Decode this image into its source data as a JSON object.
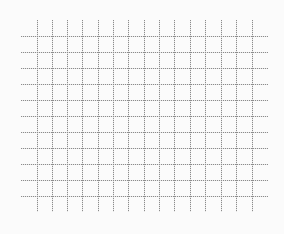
{
  "canvas": {
    "width": 284,
    "height": 234,
    "background": "#fbfbfb"
  },
  "grid": {
    "line_color": "#8c8c8c",
    "line_style": "dotted",
    "vertical_lines": {
      "count": 15,
      "x_positions": [
        37,
        52,
        67,
        82,
        98,
        113,
        128,
        144,
        159,
        174,
        190,
        205,
        221,
        236,
        252
      ],
      "y_start": 20,
      "y_end": 212
    },
    "horizontal_lines": {
      "count": 11,
      "y_positions": [
        36,
        52,
        68,
        84,
        100,
        116,
        132,
        148,
        164,
        180,
        196
      ],
      "x_start": 21,
      "x_end": 268
    }
  }
}
